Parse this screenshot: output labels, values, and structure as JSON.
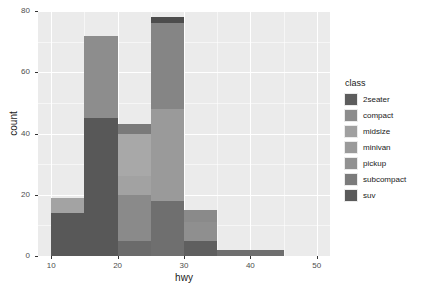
{
  "chart_data": {
    "type": "bar",
    "title": "",
    "subtitle": "",
    "xlabel": "hwy",
    "ylabel": "count",
    "xlim": [
      8,
      52
    ],
    "ylim": [
      0,
      80
    ],
    "xticks": [
      "10",
      "20",
      "30",
      "40",
      "50"
    ],
    "xtick_values": [
      10,
      20,
      30,
      40,
      50
    ],
    "yticks": [
      "0",
      "20",
      "40",
      "60",
      "80"
    ],
    "ytick_values": [
      0,
      20,
      40,
      60,
      80
    ],
    "grid": true,
    "stacked": true,
    "legend_position": "right",
    "legend_title": "class",
    "bin_width": 5,
    "bins": [
      {
        "x0": 10,
        "x1": 15,
        "total": 19
      },
      {
        "x0": 15,
        "x1": 20,
        "total": 72
      },
      {
        "x0": 20,
        "x1": 25,
        "total": 43
      },
      {
        "x0": 25,
        "x1": 30,
        "total": 78
      },
      {
        "x0": 30,
        "x1": 35,
        "total": 15
      },
      {
        "x0": 35,
        "x1": 40,
        "total": 2
      },
      {
        "x0": 40,
        "x1": 45,
        "total": 2
      }
    ],
    "categories": [
      "2seater",
      "compact",
      "midsize",
      "minivan",
      "pickup",
      "subcompact",
      "suv"
    ],
    "colors": {
      "2seater": "#4d4d4d",
      "compact": "#6e6e6e",
      "midsize": "#8c8c8c",
      "midsize_light": "#a8a8a8",
      "minivan": "#999999",
      "pickup": "#9c9c9c",
      "subcompact": "#777777",
      "suv": "#5a5a5a"
    },
    "series": [
      {
        "name": "2seater",
        "values": [
          0,
          0,
          0,
          5,
          0,
          0,
          0
        ]
      },
      {
        "name": "compact",
        "values": [
          0,
          0,
          9,
          26,
          12,
          0,
          0
        ]
      },
      {
        "name": "midsize",
        "values": [
          0,
          0,
          21,
          18,
          2,
          0,
          0
        ]
      },
      {
        "name": "minivan",
        "values": [
          0,
          3,
          8,
          0,
          0,
          0,
          0
        ]
      },
      {
        "name": "pickup",
        "values": [
          5,
          22,
          6,
          0,
          0,
          0,
          0
        ]
      },
      {
        "name": "subcompact",
        "values": [
          0,
          2,
          2,
          24,
          1,
          2,
          2
        ]
      },
      {
        "name": "suv",
        "values": [
          14,
          45,
          0,
          0,
          0,
          0,
          0
        ]
      }
    ],
    "stacks": [
      {
        "bin": 0,
        "segments": [
          {
            "class": "suv",
            "from": 0,
            "to": 14,
            "color": "#585858"
          },
          {
            "class": "pickup",
            "from": 14,
            "to": 19,
            "color": "#a3a3a3"
          }
        ]
      },
      {
        "bin": 1,
        "segments": [
          {
            "class": "suv",
            "from": 0,
            "to": 45,
            "color": "#585858"
          },
          {
            "class": "pickup",
            "from": 45,
            "to": 72,
            "color": "#8d8d8d"
          }
        ]
      },
      {
        "bin": 2,
        "segments": [
          {
            "class": "subcompact",
            "from": 0,
            "to": 5,
            "color": "#6b6b6b"
          },
          {
            "class": "pickup",
            "from": 5,
            "to": 20,
            "color": "#8a8a8a"
          },
          {
            "class": "minivan",
            "from": 20,
            "to": 26,
            "color": "#a2a2a2"
          },
          {
            "class": "midsize",
            "from": 26,
            "to": 40,
            "color": "#a8a8a8"
          },
          {
            "class": "compact",
            "from": 40,
            "to": 43,
            "color": "#7a7a7a"
          }
        ]
      },
      {
        "bin": 3,
        "segments": [
          {
            "class": "subcompact",
            "from": 0,
            "to": 18,
            "color": "#6f6f6f"
          },
          {
            "class": "midsize",
            "from": 18,
            "to": 48,
            "color": "#9a9a9a"
          },
          {
            "class": "compact",
            "from": 48,
            "to": 76,
            "color": "#858585"
          },
          {
            "class": "2seater",
            "from": 76,
            "to": 78,
            "color": "#4d4d4d"
          }
        ]
      },
      {
        "bin": 4,
        "segments": [
          {
            "class": "subcompact",
            "from": 0,
            "to": 5,
            "color": "#5f5f5f"
          },
          {
            "class": "midsize",
            "from": 5,
            "to": 11,
            "color": "#8f8f8f"
          },
          {
            "class": "compact",
            "from": 11,
            "to": 15,
            "color": "#8a8a8a"
          }
        ]
      },
      {
        "bin": 5,
        "segments": [
          {
            "class": "subcompact",
            "from": 0,
            "to": 2,
            "color": "#6e6e6e"
          }
        ]
      },
      {
        "bin": 6,
        "segments": [
          {
            "class": "subcompact",
            "from": 0,
            "to": 2,
            "color": "#6e6e6e"
          }
        ]
      }
    ],
    "legend_items": [
      {
        "label": "2seater",
        "color": "#5d5d5d"
      },
      {
        "label": "compact",
        "color": "#8c8c8c"
      },
      {
        "label": "midsize",
        "color": "#a0a0a0"
      },
      {
        "label": "minivan",
        "color": "#9a9a9a"
      },
      {
        "label": "pickup",
        "color": "#919191"
      },
      {
        "label": "subcompact",
        "color": "#7b7b7b"
      },
      {
        "label": "suv",
        "color": "#5a5a5a"
      }
    ]
  }
}
